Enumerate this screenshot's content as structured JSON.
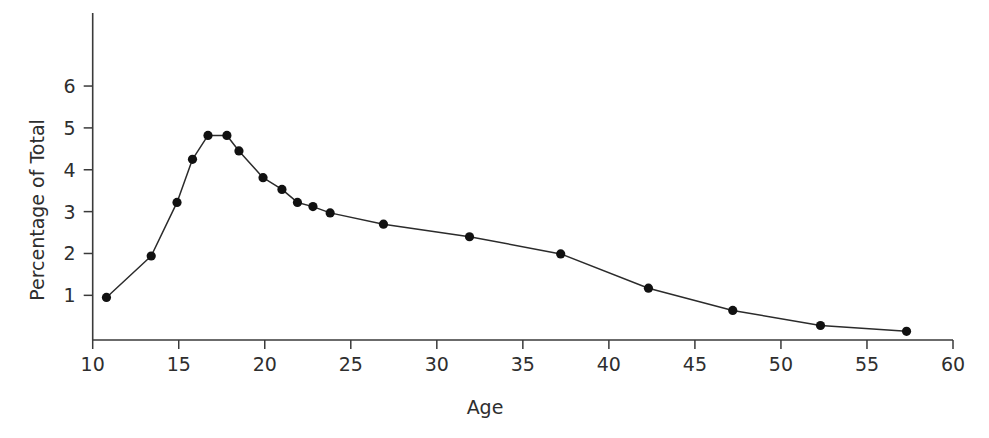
{
  "chart_data": {
    "type": "line",
    "title": "",
    "xlabel": "Age",
    "ylabel": "Percentage of Total",
    "xlim": [
      10,
      60
    ],
    "ylim": [
      0,
      6.8
    ],
    "xticks": [
      10,
      15,
      20,
      25,
      30,
      35,
      40,
      45,
      50,
      55,
      60
    ],
    "yticks": [
      1,
      2,
      3,
      4,
      5,
      6
    ],
    "grid": false,
    "legend": null,
    "markers": "filled-circle",
    "line_color": "#2b2b2b",
    "marker_color": "#111111",
    "axis_color": "#3a3a3a",
    "x": [
      10.8,
      13.4,
      14.9,
      15.8,
      16.7,
      17.8,
      18.5,
      19.9,
      21.0,
      21.9,
      22.8,
      23.8,
      26.9,
      31.9,
      37.2,
      42.3,
      47.2,
      52.3,
      57.3
    ],
    "y": [
      0.95,
      1.94,
      3.22,
      4.25,
      4.82,
      4.82,
      4.45,
      3.81,
      3.53,
      3.22,
      3.12,
      2.97,
      2.7,
      2.4,
      1.99,
      1.17,
      0.64,
      0.28,
      0.14
    ],
    "points": [
      {
        "age": 10.8,
        "pct": 0.95
      },
      {
        "age": 13.4,
        "pct": 1.94
      },
      {
        "age": 14.9,
        "pct": 3.22
      },
      {
        "age": 15.8,
        "pct": 4.25
      },
      {
        "age": 16.7,
        "pct": 4.82
      },
      {
        "age": 17.8,
        "pct": 4.82
      },
      {
        "age": 18.5,
        "pct": 4.45
      },
      {
        "age": 19.9,
        "pct": 3.81
      },
      {
        "age": 21.0,
        "pct": 3.53
      },
      {
        "age": 21.9,
        "pct": 3.22
      },
      {
        "age": 22.8,
        "pct": 3.12
      },
      {
        "age": 23.8,
        "pct": 2.97
      },
      {
        "age": 26.9,
        "pct": 2.7
      },
      {
        "age": 31.9,
        "pct": 2.4
      },
      {
        "age": 37.2,
        "pct": 1.99
      },
      {
        "age": 42.3,
        "pct": 1.17
      },
      {
        "age": 47.2,
        "pct": 0.64
      },
      {
        "age": 52.3,
        "pct": 0.28
      },
      {
        "age": 57.3,
        "pct": 0.14
      }
    ]
  },
  "labels": {
    "x_axis_title": "Age",
    "y_axis_title": "Percentage of Total",
    "x_ticks": [
      "10",
      "15",
      "20",
      "25",
      "30",
      "35",
      "40",
      "45",
      "50",
      "55",
      "60"
    ],
    "y_ticks": [
      "1",
      "2",
      "3",
      "4",
      "5",
      "6"
    ]
  }
}
